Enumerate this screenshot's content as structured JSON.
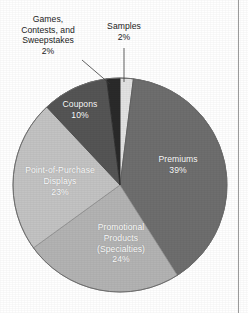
{
  "chart_data": {
    "type": "pie",
    "title": "",
    "subtitle": "",
    "xlabel": "",
    "ylabel": "",
    "legend_position": "none",
    "grid": false,
    "units": "percent",
    "total": 100,
    "start_angle_deg": 0,
    "direction": "clockwise",
    "categories": [
      "Samples",
      "Premiums",
      "Promotional Products (Specialties)",
      "Point-of-Purchase Displays",
      "Coupons",
      "Games, Contests, and Sweepstakes"
    ],
    "values": [
      2,
      39,
      24,
      23,
      10,
      2
    ],
    "slices": [
      {
        "name": "Samples",
        "value": 2,
        "value_label": "2%",
        "color": "#e2e2e2",
        "label_placement": "outside",
        "label_lines": "Samples\n2%",
        "text_color": "#1c1c1c"
      },
      {
        "name": "Premiums",
        "value": 39,
        "value_label": "39%",
        "color": "#6e6e6e",
        "label_placement": "inside",
        "label_lines": "Premiums\n39%",
        "text_color": "#ffffff"
      },
      {
        "name": "Promotional Products (Specialties)",
        "value": 24,
        "value_label": "24%",
        "color": "#b3b3b3",
        "label_placement": "inside",
        "label_lines": "Promotional\nProducts\n(Specialties)\n24%",
        "text_color": "#ffffff"
      },
      {
        "name": "Point-of-Purchase Displays",
        "value": 23,
        "value_label": "23%",
        "color": "#c3c3c3",
        "label_placement": "inside",
        "label_lines": "Point-of-Purchase\nDisplays\n23%",
        "text_color": "#ffffff"
      },
      {
        "name": "Coupons",
        "value": 10,
        "value_label": "10%",
        "color": "#555555",
        "label_placement": "inside",
        "label_lines": "Coupons\n10%",
        "text_color": "#ffffff"
      },
      {
        "name": "Games, Contests, and Sweepstakes",
        "value": 2,
        "value_label": "2%",
        "color": "#2a2a2a",
        "label_placement": "outside",
        "label_lines": "Games,\nContests, and\nSweepstakes\n2%",
        "text_color": "#1c1c1c"
      }
    ]
  },
  "figure": {
    "background_color": "#ffffff",
    "outline_color": "#5a5a5a",
    "rule_color": "#9a9a9a"
  }
}
